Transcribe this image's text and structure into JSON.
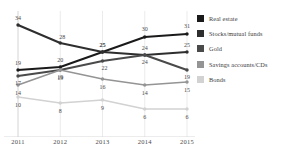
{
  "title": {
    "cropped_top_text": "",
    "cropped_right_text": ""
  },
  "legend": {
    "position": "right",
    "items": [
      {
        "label": "Real estate",
        "color": "#1a1a1a"
      },
      {
        "label": "Stocks/mutual funds",
        "color": "#2e2e2e"
      },
      {
        "label": "Gold",
        "color": "#4a4a4a"
      },
      {
        "label": "Savings accounts/CDs",
        "color": "#949494"
      },
      {
        "label": "Bonds",
        "color": "#d2d2d2"
      }
    ]
  },
  "axis": {
    "years": [
      "2011",
      "2012",
      "2013",
      "2014",
      "2015"
    ]
  },
  "chart_data": {
    "type": "line",
    "title": "",
    "xlabel": "",
    "ylabel": "",
    "categories": [
      "2011",
      "2012",
      "2013",
      "2014",
      "2015"
    ],
    "ylim": [
      0,
      36
    ],
    "grid": true,
    "legend_position": "right",
    "data_labels": true,
    "series": [
      {
        "name": "Real estate",
        "color": "#1a1a1a",
        "values": [
          19,
          20,
          25,
          30,
          31
        ]
      },
      {
        "name": "Stocks/mutual funds",
        "color": "#2e2e2e",
        "values": [
          34,
          28,
          25,
          24,
          25
        ]
      },
      {
        "name": "Gold",
        "color": "#4a4a4a",
        "values": [
          17,
          19,
          22,
          24,
          19
        ]
      },
      {
        "name": "Savings accounts/CDs",
        "color": "#949494",
        "values": [
          14,
          19,
          16,
          14,
          15
        ]
      },
      {
        "name": "Bonds",
        "color": "#d2d2d2",
        "values": [
          10,
          8,
          9,
          6,
          6
        ]
      }
    ],
    "label_offsets": {
      "Real estate": [
        [
          0,
          -7
        ],
        [
          0,
          -7
        ],
        [
          0,
          -7
        ],
        [
          0,
          -8
        ],
        [
          0,
          -8
        ]
      ],
      "Stocks/mutual funds": [
        [
          0,
          -7
        ],
        [
          2,
          -6
        ],
        [
          0,
          -7
        ],
        [
          0,
          -7
        ],
        [
          0,
          -7
        ]
      ],
      "Gold": [
        [
          0,
          7
        ],
        [
          0,
          7
        ],
        [
          2,
          7
        ],
        [
          0,
          7
        ],
        [
          0,
          7
        ]
      ],
      "Savings accounts/CDs": [
        [
          0,
          8
        ],
        [
          0,
          8
        ],
        [
          0,
          8
        ],
        [
          0,
          8
        ],
        [
          0,
          8
        ]
      ],
      "Bonds": [
        [
          0,
          8
        ],
        [
          0,
          8
        ],
        [
          0,
          8
        ],
        [
          0,
          8
        ],
        [
          0,
          8
        ]
      ]
    }
  }
}
